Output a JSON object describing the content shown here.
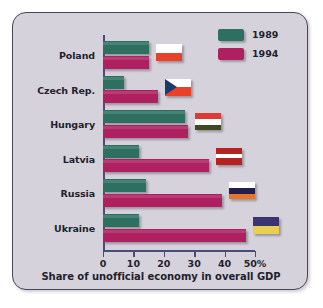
{
  "chart_data": {
    "type": "bar",
    "orientation": "horizontal",
    "title": "",
    "xlabel": "Share of unofficial economy in overall GDP",
    "ylabel": "",
    "categories": [
      "Poland",
      "Czech Rep.",
      "Hungary",
      "Latvia",
      "Russia",
      "Ukraine"
    ],
    "series": [
      {
        "name": "1989",
        "color": "#2d7060",
        "values": [
          15,
          7,
          27,
          12,
          14,
          12
        ]
      },
      {
        "name": "1994",
        "color": "#ae2060",
        "values": [
          15,
          18,
          28,
          35,
          39,
          47
        ]
      }
    ],
    "xlim": [
      0,
      50
    ],
    "xticks": [
      0,
      10,
      20,
      30,
      40,
      50
    ],
    "xtick_labels": [
      "0",
      "10",
      "20",
      "30",
      "40",
      "50%"
    ],
    "grid": false,
    "legend_position": "top-right",
    "annotations": [
      {
        "category": "Poland",
        "icon": "flag-poland"
      },
      {
        "category": "Czech Rep.",
        "icon": "flag-czech-republic"
      },
      {
        "category": "Hungary",
        "icon": "flag-hungary"
      },
      {
        "category": "Latvia",
        "icon": "flag-latvia"
      },
      {
        "category": "Russia",
        "icon": "flag-russia"
      },
      {
        "category": "Ukraine",
        "icon": "flag-ukraine"
      }
    ]
  },
  "legend": {
    "items": [
      {
        "label": "1989",
        "color": "#2d7060"
      },
      {
        "label": "1994",
        "color": "#ae2060"
      }
    ]
  },
  "caption": "Share of unofficial economy in overall GDP",
  "axis": {
    "tick_labels": [
      "0",
      "10",
      "20",
      "30",
      "40",
      "50%"
    ]
  },
  "colors": {
    "background": "#d6d2db",
    "frame_border": "#4a4458",
    "axis": "#4b4a78",
    "series_1989": "#2d7060",
    "series_1994": "#ae2060",
    "text": "#231f2e"
  }
}
